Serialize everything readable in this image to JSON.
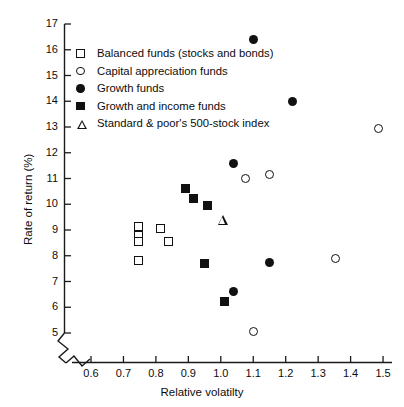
{
  "chart_data": {
    "type": "scatter",
    "title": "",
    "xlabel": "Relative volatilty",
    "ylabel": "Rate of return (%)",
    "xlim": [
      0.55,
      1.52
    ],
    "ylim": [
      4.6,
      17.2
    ],
    "xticks": [
      "0.6",
      "0.7",
      "0.8",
      "0.9",
      "1.0",
      "1.1",
      "1.2",
      "1.3",
      "1.4",
      "1.5"
    ],
    "xtick_values": [
      0.6,
      0.7,
      0.8,
      0.9,
      1.0,
      1.1,
      1.2,
      1.3,
      1.4,
      1.5
    ],
    "yticks": [
      "5",
      "6",
      "7",
      "8",
      "9",
      "10",
      "11",
      "12",
      "13",
      "14",
      "15",
      "16",
      "17"
    ],
    "ytick_values": [
      5,
      6,
      7,
      8,
      9,
      10,
      11,
      12,
      13,
      14,
      15,
      16,
      17
    ],
    "grid": false,
    "axis_break_x": true,
    "axis_break_y": true,
    "legend_position": "upper-left-inside",
    "series": [
      {
        "name": "Balanced funds (stocks and bonds)",
        "marker": "open-square",
        "color": "#111111",
        "points": [
          {
            "x": 0.745,
            "y": 9.15
          },
          {
            "x": 0.745,
            "y": 8.8
          },
          {
            "x": 0.745,
            "y": 8.55
          },
          {
            "x": 0.815,
            "y": 9.05
          },
          {
            "x": 0.84,
            "y": 8.55
          },
          {
            "x": 0.745,
            "y": 7.8
          }
        ]
      },
      {
        "name": "Capital appreciation funds",
        "marker": "open-circle",
        "color": "#111111",
        "points": [
          {
            "x": 1.485,
            "y": 12.95
          },
          {
            "x": 1.15,
            "y": 11.15
          },
          {
            "x": 1.075,
            "y": 11.0
          },
          {
            "x": 1.355,
            "y": 7.88
          },
          {
            "x": 1.1,
            "y": 5.05
          }
        ]
      },
      {
        "name": "Growth funds",
        "marker": "filled-circle",
        "color": "#111111",
        "points": [
          {
            "x": 1.1,
            "y": 16.4
          },
          {
            "x": 1.22,
            "y": 14.0
          },
          {
            "x": 1.04,
            "y": 11.58
          },
          {
            "x": 1.15,
            "y": 7.72
          },
          {
            "x": 1.04,
            "y": 6.6
          }
        ]
      },
      {
        "name": "Growth and income funds",
        "marker": "filled-square",
        "color": "#111111",
        "points": [
          {
            "x": 0.89,
            "y": 10.62
          },
          {
            "x": 0.915,
            "y": 10.24
          },
          {
            "x": 0.96,
            "y": 9.97
          },
          {
            "x": 0.95,
            "y": 7.7
          },
          {
            "x": 1.01,
            "y": 6.22
          }
        ]
      },
      {
        "name": "Standard & poor's 500-stock index",
        "marker": "open-triangle",
        "color": "#111111",
        "points": [
          {
            "x": 1.005,
            "y": 9.42
          }
        ]
      }
    ]
  },
  "legend": {
    "items": [
      {
        "label": "Balanced funds (stocks and bonds)",
        "marker": "open-square"
      },
      {
        "label": "Capital appreciation funds",
        "marker": "open-circle"
      },
      {
        "label": "Growth funds",
        "marker": "filled-circle"
      },
      {
        "label": "Growth and income funds",
        "marker": "filled-square"
      },
      {
        "label": "Standard & poor's 500-stock index",
        "marker": "open-triangle"
      }
    ]
  }
}
